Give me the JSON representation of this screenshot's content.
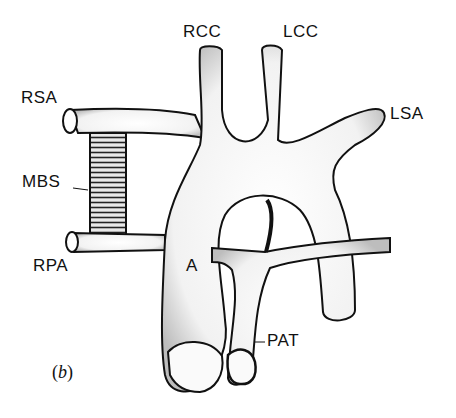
{
  "figure": {
    "panel_label": "b",
    "labels": {
      "rcc": "RCC",
      "lcc": "LCC",
      "rsa": "RSA",
      "lsa": "LSA",
      "mbs": "MBS",
      "rpa": "RPA",
      "a": "A",
      "pat": "PAT"
    },
    "colors": {
      "background": "#ffffff",
      "outline": "#111111",
      "vessel_fill": "#f7f7f7"
    }
  }
}
